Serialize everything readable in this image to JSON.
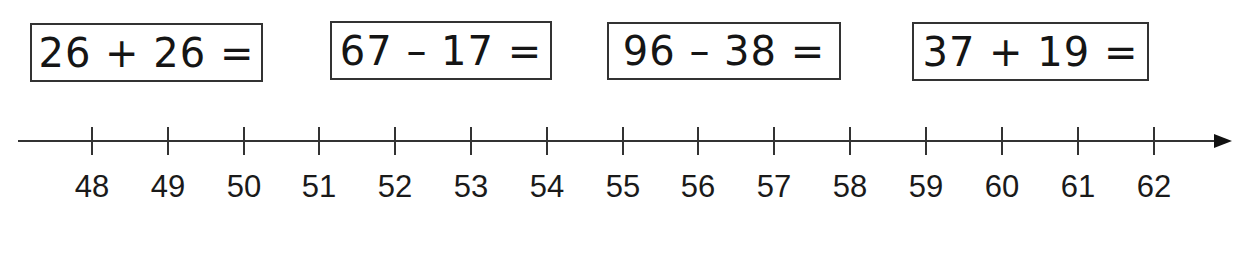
{
  "equations": [
    {
      "text": "26 + 26 =",
      "box": {
        "x": 30,
        "y": 23,
        "w": 233,
        "h": 59
      }
    },
    {
      "text": "67 – 17 =",
      "box": {
        "x": 330,
        "y": 21,
        "w": 222,
        "h": 59
      }
    },
    {
      "text": "96 – 38 =",
      "box": {
        "x": 607,
        "y": 22,
        "w": 234,
        "h": 58
      }
    },
    {
      "text": "37 + 19 =",
      "box": {
        "x": 912,
        "y": 22,
        "w": 237,
        "h": 59
      }
    }
  ],
  "number_line": {
    "start": 48,
    "end": 62,
    "step": 1,
    "labels": [
      "48",
      "49",
      "50",
      "51",
      "52",
      "53",
      "54",
      "55",
      "56",
      "57",
      "58",
      "59",
      "60",
      "61",
      "62"
    ],
    "tick_x": [
      92,
      168,
      244,
      319,
      395,
      471,
      547,
      623,
      698,
      774,
      850,
      926,
      1002,
      1078,
      1154
    ],
    "arrow_direction": "right"
  }
}
